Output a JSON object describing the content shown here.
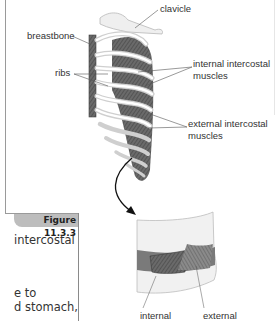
{
  "figure": {
    "caption": "Figure 11.3.3",
    "labels": {
      "clavicle": "clavicle",
      "breastbone": "breastbone",
      "ribs": "ribs",
      "internal_intercostal_line1": "internal intercostal",
      "internal_intercostal_line2": "muscles",
      "external_intercostal_line1": "external intercostal",
      "external_intercostal_line2": "muscles",
      "detail_internal": "internal",
      "detail_external": "external"
    }
  },
  "body_text": {
    "line1": "intercostal",
    "line2": "e to",
    "line3": "d stomach,"
  },
  "colors": {
    "muscle_dark": "#5a5a5a",
    "rib_light": "#e4e4e4",
    "tab_gray": "#bdbdbd"
  }
}
